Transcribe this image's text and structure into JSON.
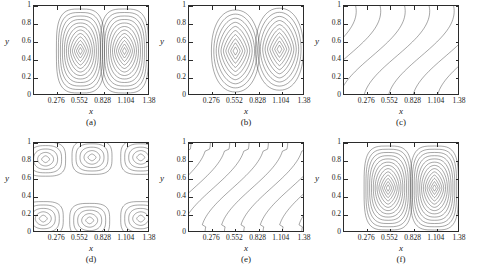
{
  "figure": {
    "axis_labels": {
      "x": "x",
      "y": "y"
    },
    "x_ticks": [
      "0.276",
      "0.552",
      "0.828",
      "1.104",
      "1.38"
    ],
    "y_ticks": [
      "1",
      "0.8",
      "0.6",
      "0.4",
      "0.2",
      "0"
    ],
    "caption": "",
    "line_color": "#3a3a3a",
    "axis_color": "#2b2b2b"
  },
  "chart_data": {
    "type": "line",
    "title": "",
    "xlabel": "x",
    "ylabel": "y",
    "xlim": [
      0,
      1.38
    ],
    "ylim": [
      0,
      1
    ],
    "grid": false,
    "legend": "none",
    "x_tick_values": [
      0.276,
      0.552,
      0.828,
      1.104,
      1.38
    ],
    "y_tick_values": [
      0,
      0.2,
      0.4,
      0.6,
      0.8,
      1
    ],
    "panels": [
      {
        "label": "(a)",
        "pattern": "two-counter-rotating-vortices",
        "n_contours": 12,
        "vortex_centers": [
          [
            0.4,
            0.5
          ],
          [
            0.78,
            0.5
          ]
        ],
        "description": "Two nested rounded-rectangular vortex cells spanning full height, separated near x=0.60"
      },
      {
        "label": "(b)",
        "pattern": "two-counter-rotating-vortices",
        "n_contours": 10,
        "vortex_centers": [
          [
            0.4,
            0.5
          ],
          [
            0.78,
            0.52
          ]
        ],
        "description": "Two smooth elliptical vortex cells, contours rounder than (a)"
      },
      {
        "label": "(c)",
        "pattern": "inclined-shear-bands",
        "n_contours": 9,
        "band_slope": 0.45,
        "description": "S-shaped contour bands inclined from lower-left to upper-right across full height"
      },
      {
        "label": "(d)",
        "pattern": "checkerboard-cells",
        "n_contours": 5,
        "vortex_centers": [
          [
            0.1,
            0.82
          ],
          [
            0.5,
            0.84
          ],
          [
            0.92,
            0.84
          ],
          [
            0.08,
            0.16
          ],
          [
            0.48,
            0.14
          ],
          [
            0.92,
            0.16
          ]
        ],
        "description": "Staggered array of six closed cells, three along the top and three along the bottom"
      },
      {
        "label": "(e)",
        "pattern": "inclined-shear-bands",
        "n_contours": 12,
        "band_slope": 0.42,
        "description": "Dense slanted bands with rounded caps near the top wall"
      },
      {
        "label": "(f)",
        "pattern": "two-counter-rotating-vortices",
        "n_contours": 13,
        "vortex_centers": [
          [
            0.38,
            0.5
          ],
          [
            0.78,
            0.5
          ]
        ],
        "description": "Two nested vortex cells, densest contour packing of all panels"
      }
    ]
  }
}
